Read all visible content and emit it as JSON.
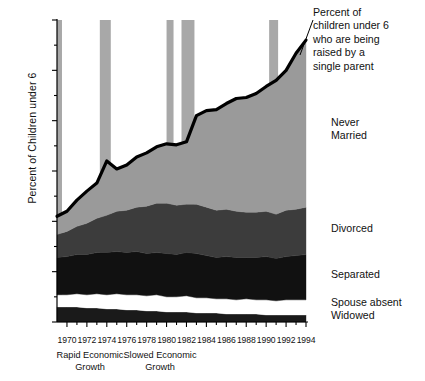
{
  "chart_data": {
    "type": "area",
    "title": "Percent of children under 6 who are being raised by a single parent",
    "xlabel": "",
    "ylabel": "Percent of Children under 6",
    "stacked": true,
    "grid": false,
    "legend_position": "right-inline",
    "xlim": [
      1969,
      1994
    ],
    "ylim": [
      0,
      30
    ],
    "ytick_labels": [
      "0%",
      "5%",
      "10%",
      "15%",
      "20%",
      "25%",
      "30%"
    ],
    "ytick_values": [
      0,
      5,
      10,
      15,
      20,
      25,
      30
    ],
    "xtick_labels": [
      "1970",
      "1972",
      "1974",
      "1976",
      "1978",
      "1980",
      "1982",
      "1984",
      "1986",
      "1988",
      "1990",
      "1992",
      "1994"
    ],
    "xtick_values": [
      1970,
      1972,
      1974,
      1976,
      1978,
      1980,
      1982,
      1984,
      1986,
      1988,
      1990,
      1992,
      1994
    ],
    "x": [
      1969,
      1970,
      1971,
      1972,
      1973,
      1974,
      1975,
      1976,
      1977,
      1978,
      1979,
      1980,
      1981,
      1982,
      1983,
      1984,
      1985,
      1986,
      1987,
      1988,
      1989,
      1990,
      1991,
      1992,
      1993,
      1994
    ],
    "series": [
      {
        "name": "Widowed",
        "color": "#1a1a1a",
        "values": [
          1.5,
          1.5,
          1.5,
          1.4,
          1.4,
          1.3,
          1.3,
          1.2,
          1.2,
          1.1,
          1.1,
          1.0,
          1.0,
          1.0,
          0.9,
          0.9,
          0.9,
          0.8,
          0.8,
          0.8,
          0.8,
          0.7,
          0.7,
          0.7,
          0.7,
          0.7
        ]
      },
      {
        "name": "Spouse absent",
        "color": "#ffffff",
        "values": [
          1.2,
          1.2,
          1.3,
          1.3,
          1.4,
          1.4,
          1.5,
          1.5,
          1.5,
          1.5,
          1.6,
          1.5,
          1.5,
          1.6,
          1.5,
          1.5,
          1.4,
          1.5,
          1.4,
          1.5,
          1.4,
          1.5,
          1.4,
          1.5,
          1.5,
          1.5
        ]
      },
      {
        "name": "Separated",
        "color": "#111111",
        "values": [
          3.7,
          3.8,
          3.9,
          4.0,
          4.1,
          4.2,
          4.2,
          4.2,
          4.3,
          4.2,
          4.2,
          4.3,
          4.2,
          4.3,
          4.4,
          4.2,
          4.1,
          4.2,
          4.2,
          4.1,
          4.2,
          4.3,
          4.2,
          4.3,
          4.4,
          4.5
        ]
      },
      {
        "name": "Divorced",
        "color": "#3c3c3c",
        "values": [
          2.3,
          2.5,
          2.8,
          3.1,
          3.4,
          3.7,
          4.0,
          4.2,
          4.4,
          4.7,
          4.9,
          5.0,
          4.9,
          4.8,
          4.9,
          4.8,
          4.7,
          4.7,
          4.6,
          4.5,
          4.5,
          4.5,
          4.4,
          4.6,
          4.6,
          4.7
        ]
      },
      {
        "name": "Never Married",
        "color": "#9a9a9a",
        "values": [
          1.8,
          2.0,
          2.6,
          3.2,
          3.5,
          5.3,
          4.2,
          4.5,
          5.0,
          5.3,
          5.6,
          5.9,
          6.0,
          6.2,
          8.8,
          9.6,
          10.0,
          10.5,
          11.2,
          11.4,
          11.8,
          12.4,
          13.3,
          13.9,
          15.5,
          16.6
        ]
      }
    ],
    "total_line": {
      "name": "Percent of children under 6 who are being raised by a single parent",
      "color": "#000000",
      "values": [
        10.5,
        11.0,
        12.1,
        13.0,
        13.8,
        16.0,
        15.2,
        15.6,
        16.4,
        16.8,
        17.4,
        17.7,
        17.6,
        17.9,
        20.5,
        21.0,
        21.1,
        21.7,
        22.2,
        22.3,
        22.7,
        23.4,
        24.0,
        25.0,
        26.7,
        28.0
      ]
    },
    "recession_bands": [
      {
        "start": 1969.0,
        "end": 1969.5
      },
      {
        "start": 1973.3,
        "end": 1974.4
      },
      {
        "start": 1980.0,
        "end": 1980.7
      },
      {
        "start": 1981.5,
        "end": 1982.8
      },
      {
        "start": 1990.3,
        "end": 1991.2
      }
    ],
    "recession_band_color": "#a8a8a8",
    "annotations": [
      {
        "id": "title",
        "text": "Percent of\nchildren  under 6\nwho are being\nraised by  a\nsingle parent"
      },
      {
        "id": "never_married",
        "text": "Never\nMarried"
      },
      {
        "id": "divorced",
        "text": "Divorced"
      },
      {
        "id": "separated",
        "text": "Separated"
      },
      {
        "id": "spouse_absent",
        "text": "Spouse absent"
      },
      {
        "id": "widowed",
        "text": "Widowed"
      },
      {
        "id": "rapid_growth",
        "text": "Rapid Economic\nGrowth"
      },
      {
        "id": "slowed_growth",
        "text": "Slowed Economic\nGrowth"
      }
    ]
  },
  "axis": {
    "y_title": "Percent of Children under 6"
  }
}
